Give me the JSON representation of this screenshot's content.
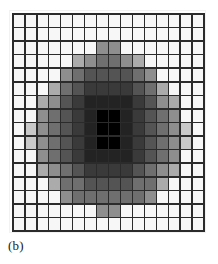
{
  "figure": {
    "caption": "(b)",
    "background_color": "#ffffff",
    "gridline_color": "#2b2b2b",
    "empty_cell_color": "#f7f7f7"
  },
  "chart_data": {
    "type": "heatmap",
    "title": "(b)",
    "subtitle": "",
    "xlabel": "",
    "ylabel": "",
    "rows": 16,
    "cols": 16,
    "grid": true,
    "legend": "none",
    "value_range": [
      0,
      9
    ],
    "colormap": [
      "#f7f7f7",
      "#e6e6e6",
      "#c9c9c9",
      "#ababab",
      "#8e8e8e",
      "#6f6f6f",
      "#545454",
      "#3a3a3a",
      "#232323",
      "#000000"
    ],
    "values": [
      [
        0,
        0,
        0,
        0,
        0,
        0,
        0,
        0,
        0,
        0,
        0,
        0,
        0,
        0,
        0,
        0
      ],
      [
        0,
        0,
        0,
        0,
        0,
        0,
        0,
        0,
        0,
        0,
        0,
        0,
        0,
        0,
        0,
        0
      ],
      [
        0,
        0,
        0,
        0,
        0,
        0,
        0,
        4,
        4,
        0,
        0,
        0,
        0,
        0,
        0,
        0
      ],
      [
        0,
        0,
        0,
        0,
        0,
        3,
        4,
        5,
        5,
        4,
        3,
        0,
        0,
        0,
        0,
        0
      ],
      [
        0,
        0,
        0,
        0,
        4,
        5,
        6,
        6,
        6,
        6,
        5,
        4,
        0,
        0,
        0,
        0
      ],
      [
        0,
        0,
        0,
        3,
        5,
        6,
        7,
        7,
        7,
        7,
        6,
        5,
        3,
        0,
        0,
        0
      ],
      [
        0,
        0,
        3,
        4,
        6,
        7,
        8,
        8,
        8,
        8,
        7,
        6,
        4,
        3,
        0,
        0
      ],
      [
        0,
        0,
        4,
        5,
        6,
        7,
        8,
        9,
        9,
        8,
        7,
        6,
        5,
        4,
        0,
        0
      ],
      [
        0,
        2,
        4,
        5,
        6,
        7,
        8,
        9,
        9,
        8,
        7,
        6,
        5,
        4,
        2,
        0
      ],
      [
        0,
        2,
        4,
        5,
        6,
        7,
        8,
        9,
        9,
        8,
        7,
        6,
        5,
        4,
        2,
        0
      ],
      [
        0,
        0,
        4,
        5,
        6,
        7,
        8,
        8,
        8,
        8,
        7,
        6,
        5,
        4,
        0,
        0
      ],
      [
        0,
        0,
        3,
        4,
        5,
        6,
        7,
        7,
        7,
        7,
        6,
        5,
        4,
        3,
        0,
        0
      ],
      [
        0,
        0,
        0,
        3,
        5,
        5,
        6,
        6,
        6,
        6,
        5,
        5,
        3,
        0,
        0,
        0
      ],
      [
        0,
        0,
        0,
        0,
        4,
        5,
        5,
        5,
        5,
        5,
        5,
        4,
        0,
        0,
        0,
        0
      ],
      [
        0,
        0,
        0,
        0,
        0,
        0,
        0,
        4,
        4,
        0,
        0,
        0,
        0,
        0,
        0,
        0
      ],
      [
        0,
        0,
        0,
        0,
        0,
        0,
        0,
        0,
        0,
        0,
        0,
        0,
        0,
        0,
        0,
        0
      ]
    ]
  }
}
